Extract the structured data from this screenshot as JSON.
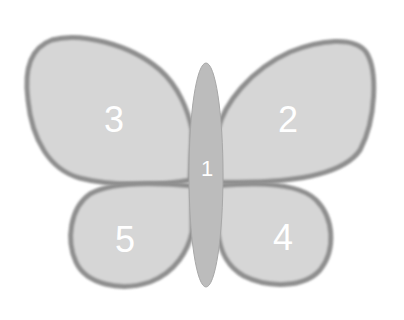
{
  "diagram": {
    "type": "butterfly-regions",
    "regions": [
      {
        "id": "body",
        "label": "1"
      },
      {
        "id": "upper-right-wing",
        "label": "2"
      },
      {
        "id": "upper-left-wing",
        "label": "3"
      },
      {
        "id": "lower-right-wing",
        "label": "4"
      },
      {
        "id": "lower-left-wing",
        "label": "5"
      }
    ]
  },
  "colors": {
    "wing_fill": "#d6d6d6",
    "wing_outline": "#8f8f8f",
    "body_fill": "#bcbcbc",
    "label": "#ffffff",
    "background": "#ffffff"
  }
}
